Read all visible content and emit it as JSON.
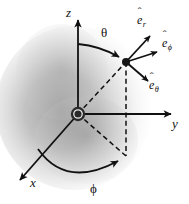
{
  "figure": {
    "background_color": "#ffffff",
    "ink_color": "#111111",
    "shading_color": "#9a9a9a"
  },
  "axes": [
    {
      "id": "z",
      "label": "z",
      "direction": "up",
      "arrow": true
    },
    {
      "id": "y",
      "label": "y",
      "direction": "right",
      "arrow": true
    },
    {
      "id": "x",
      "label": "x",
      "direction": "down-left",
      "arrow": true
    }
  ],
  "angles": [
    {
      "id": "theta",
      "label": "θ",
      "from": "z-axis",
      "to": "radial-line",
      "arc_arrow": true
    },
    {
      "id": "phi",
      "label": "ϕ",
      "from": "x-axis",
      "to": "xy-projection",
      "arc_arrow": true
    }
  ],
  "unit_vectors": [
    {
      "id": "e-r",
      "hat": "ˆ",
      "base": "e",
      "sub": "r",
      "label": "ê_r",
      "direction": "up-right"
    },
    {
      "id": "e-phi",
      "hat": "ˆ",
      "base": "e",
      "sub": "ϕ",
      "label": "ê_ϕ",
      "direction": "right"
    },
    {
      "id": "e-theta",
      "hat": "ˆ",
      "base": "e",
      "sub": "θ",
      "label": "ê_θ",
      "direction": "down-right"
    }
  ],
  "markers": [
    {
      "id": "origin",
      "kind": "ringed-dot"
    },
    {
      "id": "point-p",
      "kind": "dot"
    }
  ],
  "construction_lines": [
    {
      "id": "radial-line",
      "style": "dashed",
      "from": "origin",
      "to": "point-p"
    },
    {
      "id": "projection-line",
      "style": "dashed",
      "from": "point-p",
      "to": "xy-projection"
    },
    {
      "id": "xy-radius",
      "style": "dashed",
      "from": "origin",
      "to": "xy-projection"
    }
  ]
}
